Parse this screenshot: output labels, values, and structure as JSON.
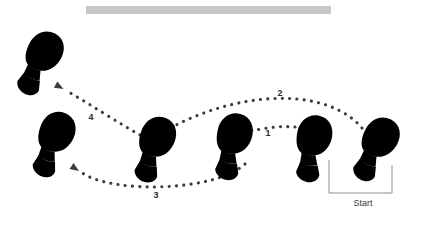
{
  "diagram": {
    "bar": {
      "name": "top-gray-bar",
      "x": 86,
      "y": 6,
      "width": 245,
      "height": 8,
      "color": "#c6c6c6"
    },
    "colors": {
      "dark_shoe_fill": "#3a3a3a",
      "dark_shoe_stroke": "#1a1a1a",
      "light_shoe_fill": "#dcdcdc",
      "light_shoe_stroke": "#8a8a8a",
      "shoe_arch": "#ffffff",
      "path_dot": "#3d3d3d",
      "bracket_line": "#8f8f8f",
      "text": "#2b2b2b",
      "background": "#ffffff"
    },
    "footprints": [
      {
        "id": "foot-start-right-dark",
        "shade": "dark",
        "cx": 377,
        "cy": 146,
        "rotation": 28,
        "scale": 1.0
      },
      {
        "id": "foot-start-left-light",
        "shade": "light",
        "cx": 313,
        "cy": 145,
        "rotation": 12,
        "scale": 1.0
      },
      {
        "id": "foot-step1-light",
        "shade": "light",
        "cx": 233,
        "cy": 143,
        "rotation": 14,
        "scale": 1.0
      },
      {
        "id": "foot-step2-dark",
        "shade": "dark",
        "cx": 155,
        "cy": 146,
        "rotation": 20,
        "scale": 1.0
      },
      {
        "id": "foot-step3-light",
        "shade": "light",
        "cx": 54,
        "cy": 141,
        "rotation": 22,
        "scale": 1.0
      },
      {
        "id": "foot-step4-dark",
        "shade": "dark",
        "cx": 41,
        "cy": 60,
        "rotation": 28,
        "scale": 1.0
      }
    ],
    "paths": [
      {
        "id": "path-1",
        "label": "1",
        "label_x": 268,
        "label_y": 136,
        "from": "foot-start-left-light",
        "to": "foot-step1-light",
        "d": "M 295 127 C 285 126 270 127 256 130"
      },
      {
        "id": "path-2",
        "label": "2",
        "label_x": 280,
        "label_y": 96,
        "from": "foot-start-right-dark",
        "to": "foot-step2-dark",
        "d": "M 362 128 C 330 90 250 88 176 125"
      },
      {
        "id": "path-3",
        "label": "3",
        "label_x": 156,
        "label_y": 198,
        "from": "foot-step1-light",
        "to": "foot-step3-light",
        "d": "M 245 164 C 215 192 110 194 81 172"
      },
      {
        "id": "path-4",
        "label": "4",
        "label_x": 91,
        "label_y": 120,
        "from": "foot-step2-dark",
        "to": "foot-step4-dark",
        "d": "M 140 135 C 120 124 90 104 65 90"
      }
    ],
    "start_bracket": {
      "id": "start-bracket",
      "label": "Start",
      "left_x": 329,
      "right_x": 392,
      "base_y": 193,
      "left_top_y": 160,
      "right_top_y": 165,
      "label_x": 363,
      "label_y": 206
    }
  }
}
